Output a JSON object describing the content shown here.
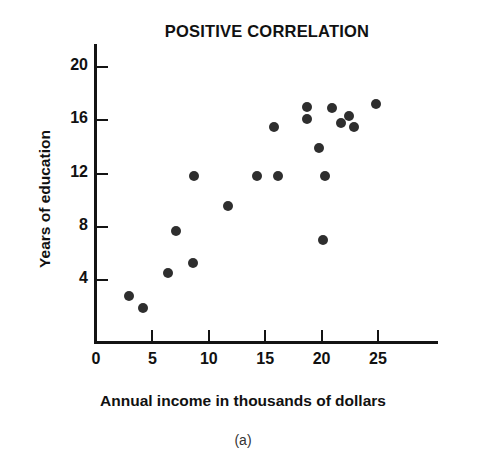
{
  "chart_data": {
    "type": "scatter",
    "title": "POSITIVE CORRELATION",
    "caption": "(a)",
    "xlabel": "Annual income in thousands of dollars",
    "ylabel": "Years of education",
    "xlim": [
      0,
      30.5
    ],
    "ylim": [
      0,
      21.5
    ],
    "grid": false,
    "legend": null,
    "x_ticks": [
      {
        "value": 0,
        "label": "0"
      },
      {
        "value": 5,
        "label": "5"
      },
      {
        "value": 10,
        "label": "10"
      },
      {
        "value": 15,
        "label": "15"
      },
      {
        "value": 20,
        "label": "20"
      },
      {
        "value": 25,
        "label": "25"
      }
    ],
    "y_ticks": [
      {
        "value": 4,
        "label": "4"
      },
      {
        "value": 8,
        "label": "8"
      },
      {
        "value": 12,
        "label": "12"
      },
      {
        "value": 16,
        "label": "16"
      },
      {
        "value": 20,
        "label": "20"
      }
    ],
    "marker": {
      "shape": "circle",
      "color": "#2e2e2e",
      "size_px": 10
    },
    "points": [
      {
        "x": 2.9,
        "y": 2.8
      },
      {
        "x": 4.2,
        "y": 1.9
      },
      {
        "x": 6.4,
        "y": 4.5
      },
      {
        "x": 7.1,
        "y": 7.7
      },
      {
        "x": 8.6,
        "y": 5.3
      },
      {
        "x": 8.7,
        "y": 11.8
      },
      {
        "x": 11.7,
        "y": 9.6
      },
      {
        "x": 14.3,
        "y": 11.8
      },
      {
        "x": 15.8,
        "y": 15.5
      },
      {
        "x": 16.1,
        "y": 11.8
      },
      {
        "x": 18.7,
        "y": 17.0
      },
      {
        "x": 18.7,
        "y": 16.1
      },
      {
        "x": 19.8,
        "y": 13.9
      },
      {
        "x": 20.3,
        "y": 11.8
      },
      {
        "x": 20.1,
        "y": 7.0
      },
      {
        "x": 20.9,
        "y": 16.9
      },
      {
        "x": 21.7,
        "y": 15.8
      },
      {
        "x": 22.4,
        "y": 16.3
      },
      {
        "x": 22.9,
        "y": 15.5
      },
      {
        "x": 24.8,
        "y": 17.2
      }
    ]
  },
  "title": {
    "text": "POSITIVE CORRELATION"
  },
  "axes": {
    "x_label": "Annual income in thousands of dollars",
    "y_label": "Years of education"
  },
  "caption": {
    "text": "(a)"
  }
}
